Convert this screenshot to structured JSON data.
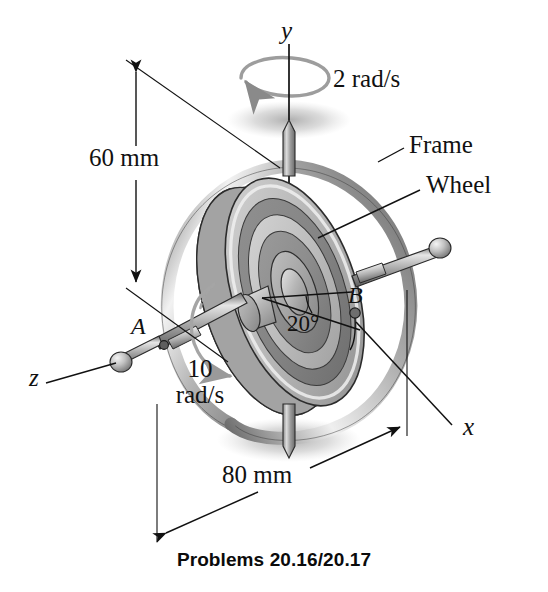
{
  "figure": {
    "caption": "Problems 20.16/20.17",
    "axes": [
      {
        "name": "y-axis-label",
        "text": "y"
      },
      {
        "name": "x-axis-label",
        "text": "x"
      },
      {
        "name": "z-axis-label",
        "text": "z"
      }
    ],
    "dimensions": [
      {
        "name": "vertical-dimension",
        "text": "60 mm",
        "value": 60,
        "unit": "mm"
      },
      {
        "name": "horizontal-dimension",
        "text": "80 mm",
        "value": 80,
        "unit": "mm"
      }
    ],
    "angle": {
      "text": "20°",
      "value": 20,
      "unit": "deg"
    },
    "callouts": [
      {
        "name": "frame-callout",
        "text": "Frame"
      },
      {
        "name": "wheel-callout",
        "text": "Wheel"
      }
    ],
    "points": [
      {
        "name": "point-a",
        "text": "A"
      },
      {
        "name": "point-b",
        "text": "B"
      }
    ],
    "rates": [
      {
        "name": "precession-rate",
        "text": "2 rad/s",
        "value": 2,
        "unit": "rad/s"
      },
      {
        "name": "spin-rate-line1",
        "text": "10",
        "value": 10,
        "unit": "rad/s"
      },
      {
        "name": "spin-rate-line2",
        "text": "rad/s"
      }
    ],
    "colors": {
      "ink": "#111111",
      "line": "#1a1a1a",
      "metal_light": "#e8e8e8",
      "metal_mid": "#b9b9b9",
      "metal_dark": "#7d7d7d",
      "wheel_band_light": "#cfcfcf",
      "wheel_band_mid": "#a8a8a8",
      "wheel_band_dark": "#8a8a8a",
      "shadow": "#b0b0b0",
      "background": "#ffffff"
    }
  }
}
